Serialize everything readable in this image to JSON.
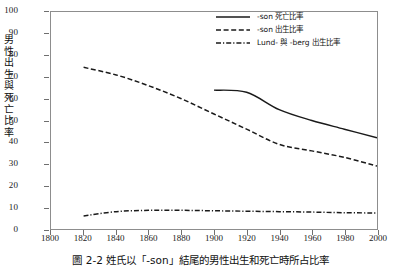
{
  "chart_data": {
    "type": "line",
    "title": "",
    "xlabel": "",
    "ylabel": "男性出生與死亡比率",
    "xlim": [
      1800,
      2000
    ],
    "ylim": [
      0,
      100
    ],
    "xticks": [
      1800,
      1820,
      1840,
      1860,
      1880,
      1900,
      1920,
      1940,
      1960,
      1980,
      2000
    ],
    "yticks": [
      0,
      10,
      20,
      30,
      40,
      50,
      60,
      70,
      80,
      90,
      100
    ],
    "grid": false,
    "legend_position": "top-right",
    "series": [
      {
        "name": "-son 死亡比率",
        "style": "solid",
        "color": "#1a1a1a",
        "x": [
          1900,
          1920,
          1940,
          1960,
          1980,
          2000
        ],
        "values": [
          64,
          63,
          55,
          50,
          46,
          42
        ]
      },
      {
        "name": "-son 出生比率",
        "style": "dashed",
        "color": "#1a1a1a",
        "x": [
          1820,
          1840,
          1860,
          1880,
          1900,
          1920,
          1940,
          1960,
          1980,
          2000
        ],
        "values": [
          74.5,
          71,
          66,
          60,
          53,
          46,
          39,
          36,
          33,
          29
        ]
      },
      {
        "name": "Lund- 與 -berg 出生比率",
        "style": "dash-dot",
        "color": "#1a1a1a",
        "x": [
          1820,
          1840,
          1860,
          1880,
          1900,
          1920,
          1940,
          1960,
          1980,
          2000
        ],
        "values": [
          6,
          8,
          8.6,
          8.6,
          8.4,
          8.2,
          8,
          7.8,
          7.5,
          7.4
        ]
      }
    ]
  },
  "caption": "圖 2-2   姓氏以「-son」結尾的男性出生和死亡時所占比率"
}
